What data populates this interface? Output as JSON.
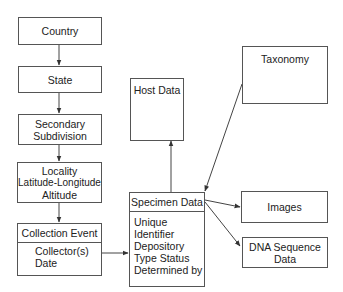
{
  "nodes": {
    "country": {
      "label": "Country"
    },
    "state": {
      "label": "State"
    },
    "secondary_subdivision": {
      "line1": "Secondary",
      "line2": "Subdivision"
    },
    "locality": {
      "line1": "Locality",
      "line2": "Latitude-Longitude",
      "line3": "Altitude"
    },
    "collection_event": {
      "title": "Collection Event",
      "fields": [
        "Collector(s)",
        "Date"
      ]
    },
    "host_data": {
      "label": "Host Data"
    },
    "specimen_data": {
      "title": "Specimen Data",
      "fields": [
        "Unique Identifier",
        "Depository",
        "Type Status",
        "Determined by"
      ]
    },
    "taxonomy": {
      "label": "Taxonomy"
    },
    "images": {
      "label": "Images"
    },
    "dna_sequence_data": {
      "line1": "DNA Sequence",
      "line2": "Data"
    }
  },
  "edges": [
    {
      "from": "country",
      "to": "state"
    },
    {
      "from": "state",
      "to": "secondary_subdivision"
    },
    {
      "from": "secondary_subdivision",
      "to": "locality"
    },
    {
      "from": "locality",
      "to": "collection_event"
    },
    {
      "from": "collection_event",
      "to": "specimen_data"
    },
    {
      "from": "specimen_data",
      "to": "host_data"
    },
    {
      "from": "taxonomy",
      "to": "specimen_data"
    },
    {
      "from": "specimen_data",
      "to": "images"
    },
    {
      "from": "specimen_data",
      "to": "dna_sequence_data"
    }
  ],
  "colors": {
    "stroke": "#555555",
    "text": "#222222",
    "background": "#ffffff"
  }
}
